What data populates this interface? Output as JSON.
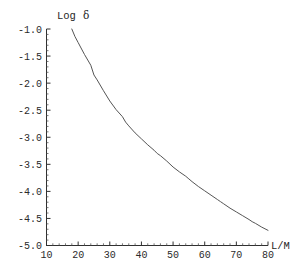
{
  "chart_data": {
    "type": "line",
    "title": "",
    "xlabel": "L/M",
    "ylabel": "Log δ",
    "ylabel_text": "Log",
    "ylabel_symbol": "δ",
    "xlim": [
      10,
      80
    ],
    "ylim": [
      -5.0,
      -1.0
    ],
    "grid": false,
    "legend": null,
    "x_ticks": [
      10,
      20,
      30,
      40,
      50,
      60,
      70,
      80
    ],
    "x_tick_labels": [
      "10",
      "20",
      "30",
      "40",
      "50",
      "60",
      "70",
      "80"
    ],
    "y_ticks": [
      -1.0,
      -1.5,
      -2.0,
      -2.5,
      -3.0,
      -3.5,
      -4.0,
      -4.5,
      -5.0
    ],
    "y_tick_labels": [
      "-1.0",
      "-1.5",
      "-2.0",
      "-2.5",
      "-3.0",
      "-3.5",
      "-4.0",
      "-4.5",
      "-5.0"
    ],
    "x_minor_tick_step": 2,
    "y_minor_tick_step": 0.1,
    "series": [
      {
        "name": "Log delta vs L/M",
        "color": "#555555",
        "line_width": 1,
        "x": [
          18,
          19,
          20,
          22,
          24,
          25,
          26,
          28,
          30,
          32,
          34,
          35,
          36,
          38,
          40,
          42,
          44,
          45,
          46,
          48,
          50,
          52,
          54,
          55,
          56,
          58,
          60,
          62,
          64,
          65,
          66,
          68,
          70,
          72,
          74,
          75,
          76,
          78,
          80
        ],
        "y": [
          -1.0,
          -1.14,
          -1.25,
          -1.47,
          -1.67,
          -1.85,
          -1.94,
          -2.14,
          -2.33,
          -2.49,
          -2.62,
          -2.72,
          -2.79,
          -2.92,
          -3.03,
          -3.14,
          -3.24,
          -3.3,
          -3.34,
          -3.44,
          -3.55,
          -3.64,
          -3.72,
          -3.77,
          -3.82,
          -3.91,
          -3.99,
          -4.07,
          -4.15,
          -4.19,
          -4.23,
          -4.31,
          -4.38,
          -4.45,
          -4.52,
          -4.56,
          -4.59,
          -4.66,
          -4.72
        ]
      }
    ]
  },
  "axes": {
    "y_axis_name": "y-axis",
    "x_axis_name": "x-axis"
  }
}
